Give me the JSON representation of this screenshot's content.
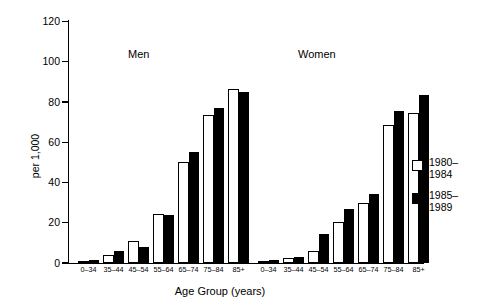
{
  "chart_data": {
    "type": "bar",
    "title": "",
    "xlabel": "Age Group (years)",
    "ylabel": "per 1,000",
    "ylim": [
      0,
      120
    ],
    "yticks": [
      0,
      20,
      40,
      60,
      80,
      100,
      120
    ],
    "ytick_labels": [
      "0",
      "20",
      "40",
      "60",
      "80",
      "100",
      "120"
    ],
    "grid": false,
    "legend_position": "right",
    "panels": [
      {
        "name": "Men",
        "label": "Men",
        "categories": [
          "0–34",
          "35–44",
          "45–54",
          "55–64",
          "65–74",
          "75–84",
          "85+"
        ],
        "series": [
          {
            "name": "1980–1984",
            "values": [
              1,
              4,
              11,
              24.5,
              50,
              73.5,
              86.5
            ]
          },
          {
            "name": "1985–1989",
            "values": [
              1.5,
              6,
              8,
              24,
              55,
              77,
              85
            ]
          }
        ]
      },
      {
        "name": "Women",
        "label": "Women",
        "categories": [
          "0–34",
          "35–44",
          "45–54",
          "55–64",
          "65–74",
          "75–84",
          "85+"
        ],
        "series": [
          {
            "name": "1980–1984",
            "values": [
              1,
              2.5,
              6,
              20.5,
              30,
              68.5,
              74.5
            ]
          },
          {
            "name": "1985–1989",
            "values": [
              1.5,
              3,
              14.5,
              27,
              34.5,
              75.5,
              83.5
            ]
          }
        ]
      }
    ],
    "legend": [
      {
        "label": "1980–\n1984",
        "line1": "1980–",
        "line2": "1984",
        "style": "open",
        "color": "#ffffff"
      },
      {
        "label": "1985–\n1989",
        "line1": "1985–",
        "line2": "1989",
        "style": "filled",
        "color": "#000000"
      }
    ],
    "colors": {
      "series_1980_1984": "#ffffff",
      "series_1985_1989": "#000000",
      "axis": "#000000"
    }
  }
}
